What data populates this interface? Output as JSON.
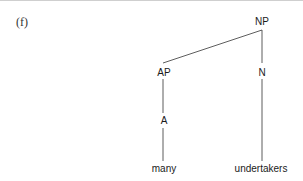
{
  "example_label": "(f)",
  "tree": {
    "root": "NP",
    "nodes": {
      "np": {
        "label": "NP"
      },
      "ap": {
        "label": "AP"
      },
      "n": {
        "label": "N"
      },
      "a": {
        "label": "A"
      },
      "many": {
        "label": "many"
      },
      "undertakers": {
        "label": "undertakers"
      }
    },
    "edges": [
      [
        "NP",
        "AP"
      ],
      [
        "NP",
        "N"
      ],
      [
        "AP",
        "A"
      ],
      [
        "A",
        "many"
      ],
      [
        "N",
        "undertakers"
      ]
    ]
  },
  "colors": {
    "line": "#333333",
    "text": "#1a1a1a"
  }
}
